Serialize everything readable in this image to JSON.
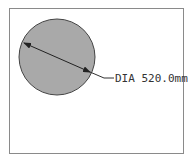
{
  "diagram": {
    "shape": "circle",
    "dimension_label": "DIA 520.0mm",
    "colors": {
      "fill": "#a9a9a9",
      "stroke": "#444444",
      "frame": "#8a8a8a",
      "text": "#333333"
    }
  }
}
